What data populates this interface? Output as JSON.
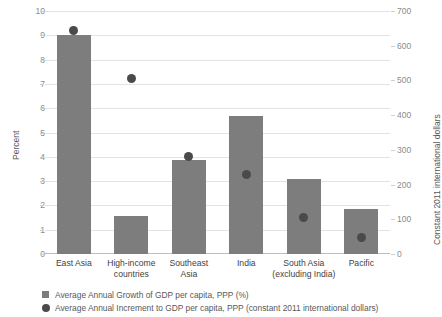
{
  "chart_data": {
    "type": "bar",
    "title": "",
    "subtitle": "",
    "xlabel": "",
    "categories": [
      "East Asia",
      "High-income countries",
      "Southeast Asia",
      "India",
      "South Asia (excluding India)",
      "Pacific"
    ],
    "category_lines": [
      [
        "East Asia"
      ],
      [
        "High-income",
        "countries"
      ],
      [
        "Southeast",
        "Asia"
      ],
      [
        "India"
      ],
      [
        "South Asia",
        "(excluding India)"
      ],
      [
        "Pacific"
      ]
    ],
    "series": [
      {
        "name": "Average Annual Growth of GDP per capita, PPP (%)",
        "type": "bar",
        "axis": "left",
        "unit": "%",
        "color": "#7d7d7d",
        "values": [
          9.0,
          1.55,
          3.85,
          5.7,
          3.1,
          1.85
        ]
      },
      {
        "name": "Average Annual Increment to GDP per capita, PPP (constant 2011 international dollars)",
        "type": "scatter",
        "axis": "right",
        "unit": "constant 2011 international dollars",
        "color": "#4a4a4a",
        "values": [
          645,
          505,
          280,
          228,
          105,
          47
        ]
      }
    ],
    "left_axis": {
      "label": "Percent",
      "ylim": [
        0,
        10
      ],
      "ticks": [
        0,
        1,
        2,
        3,
        4,
        5,
        6,
        7,
        8,
        9,
        10
      ],
      "tick_labels": [
        "0",
        "1",
        "2",
        "3",
        "4",
        "5",
        "6",
        "7",
        "8",
        "9",
        "10"
      ]
    },
    "right_axis": {
      "label": "Constant 2011 international dollars",
      "ylim": [
        0,
        700
      ],
      "ticks": [
        0,
        100,
        200,
        300,
        400,
        500,
        600,
        700
      ],
      "tick_labels": [
        "0",
        "100",
        "200",
        "300",
        "400",
        "500",
        "600",
        "700"
      ]
    },
    "grid": true,
    "legend_position": "bottom-left",
    "legend": [
      {
        "marker": "square",
        "color": "#7d7d7d",
        "label": "Average Annual Growth of GDP per capita, PPP (%)"
      },
      {
        "marker": "circle",
        "color": "#4a4a4a",
        "label": "Average Annual Increment to GDP per capita, PPP (constant 2011 international dollars)"
      }
    ]
  }
}
